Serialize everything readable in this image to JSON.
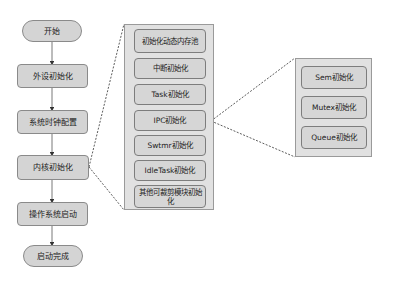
{
  "main_flow": [
    {
      "id": "start",
      "label": "开始",
      "shape": "stadium"
    },
    {
      "id": "peripheral-init",
      "label": "外设初始化",
      "shape": "rect"
    },
    {
      "id": "clock-config",
      "label": "系统时钟配置",
      "shape": "rect"
    },
    {
      "id": "kernel-init",
      "label": "内核初始化",
      "shape": "rect"
    },
    {
      "id": "os-start",
      "label": "操作系统启动",
      "shape": "rect"
    },
    {
      "id": "boot-complete",
      "label": "启动完成",
      "shape": "stadium"
    }
  ],
  "kernel_init_detail": {
    "expands": "内核初始化",
    "items": [
      {
        "label": "初始化动态内存池"
      },
      {
        "label": "中断初始化"
      },
      {
        "label": "Task初始化"
      },
      {
        "label": "IPC初始化"
      },
      {
        "label": "Swtmr初始化"
      },
      {
        "label": "IdleTask初始化"
      },
      {
        "label": "其他可裁剪模块初始化"
      }
    ]
  },
  "ipc_init_detail": {
    "expands": "IPC初始化",
    "items": [
      {
        "label": "Sem初始化"
      },
      {
        "label": "Mutex初始化"
      },
      {
        "label": "Queue初始化"
      }
    ]
  },
  "colors": {
    "node_fill": "#d4d4d4",
    "node_border": "#8a8a8a",
    "panel_fill": "#e1e1e1",
    "line": "#333333"
  }
}
